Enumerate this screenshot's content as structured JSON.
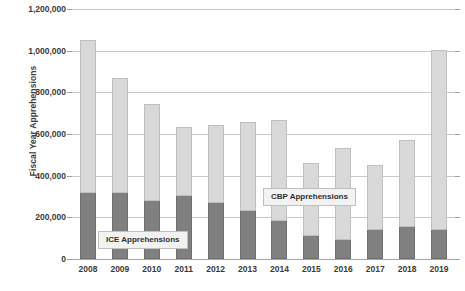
{
  "chart_data": {
    "type": "bar",
    "stacked": true,
    "title": "",
    "xlabel": "",
    "ylabel": "Fiscal Year Apprehensions",
    "ylim": [
      0,
      1200000
    ],
    "ytick_step": 200000,
    "grid": true,
    "categories": [
      "2008",
      "2009",
      "2010",
      "2011",
      "2012",
      "2013",
      "2014",
      "2015",
      "2016",
      "2017",
      "2018",
      "2019"
    ],
    "ytick_labels": [
      "1,200,000",
      "1,000,000",
      "800,000",
      "600,000",
      "400,000",
      "200,000",
      "0"
    ],
    "ytick_values": [
      1200000,
      1000000,
      800000,
      600000,
      400000,
      200000,
      0
    ],
    "series": [
      {
        "name": "ICE Apprehensions",
        "color": "#808080",
        "values": [
          317000,
          317000,
          278000,
          302000,
          269000,
          230000,
          182000,
          110000,
          91000,
          139000,
          154000,
          139000
        ]
      },
      {
        "name": "CBP Apprehensions",
        "color": "#d9d9d9",
        "values": [
          734000,
          552000,
          466000,
          331000,
          374000,
          427000,
          485000,
          350000,
          442000,
          312000,
          417000,
          866000
        ]
      }
    ],
    "totals": [
      1051000,
      869000,
      744000,
      633000,
      643000,
      657000,
      667000,
      460000,
      533000,
      451000,
      571000,
      1005000
    ],
    "legend": [
      {
        "key": "ice",
        "label": "ICE Apprehensions",
        "position": "inside-lower-left"
      },
      {
        "key": "cbp",
        "label": "CBP Apprehensions",
        "position": "inside-middle-right"
      }
    ],
    "colors": {
      "ice": "#808080",
      "cbp": "#d9d9d9",
      "grid": "#c8c8c8",
      "axis": "#a6a6a6",
      "text": "#3b3b3b",
      "legend_background": "#f2f2f2",
      "legend_border": "#bfbfbf",
      "background": "#ffffff"
    }
  }
}
